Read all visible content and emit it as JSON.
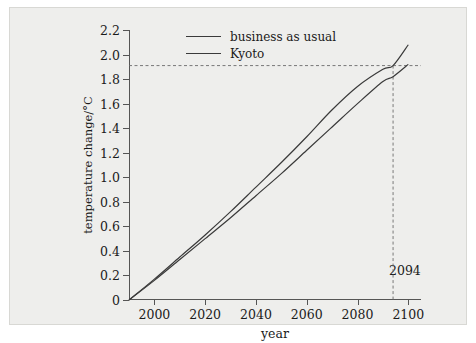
{
  "chart_data": {
    "type": "line",
    "title": "",
    "xlabel": "year",
    "ylabel": "temperature change/°C",
    "xlim": [
      1990,
      2105
    ],
    "ylim": [
      0,
      2.2
    ],
    "grid": false,
    "legend_position": "top-left-inside",
    "x_ticks": [
      2000,
      2020,
      2040,
      2060,
      2080,
      2100
    ],
    "x_tick_labels": [
      "2000",
      "2020",
      "2040",
      "2060",
      "2080",
      "2100"
    ],
    "y_ticks": [
      0,
      0.2,
      0.4,
      0.6,
      0.8,
      1.0,
      1.2,
      1.4,
      1.6,
      1.8,
      2.0,
      2.2
    ],
    "y_tick_labels": [
      "0",
      "0.2",
      "0.4",
      "0.6",
      "0.8",
      "1.0",
      "1.2",
      "1.4",
      "1.6",
      "1.8",
      "2.0",
      "2.2"
    ],
    "x": [
      1990,
      2000,
      2010,
      2020,
      2030,
      2040,
      2050,
      2060,
      2070,
      2080,
      2090,
      2094,
      2100
    ],
    "series": [
      {
        "name": "business as usual",
        "color": "#3a3a3a",
        "values": [
          0.0,
          0.17,
          0.35,
          0.53,
          0.72,
          0.92,
          1.12,
          1.33,
          1.55,
          1.74,
          1.88,
          1.91,
          2.08
        ]
      },
      {
        "name": "Kyoto",
        "color": "#3a3a3a",
        "values": [
          0.0,
          0.16,
          0.33,
          0.5,
          0.67,
          0.85,
          1.03,
          1.22,
          1.41,
          1.6,
          1.78,
          1.82,
          1.92
        ]
      }
    ],
    "annotations": [
      {
        "label": "2094",
        "x": 2094,
        "y": 1.91,
        "note": "year at which business-as-usual curve reaches the Kyoto 2100 level"
      }
    ],
    "reference_lines": [
      {
        "orientation": "horizontal",
        "value": 1.91,
        "style": "dashed"
      },
      {
        "orientation": "vertical",
        "value": 2094,
        "style": "dashed"
      }
    ]
  }
}
